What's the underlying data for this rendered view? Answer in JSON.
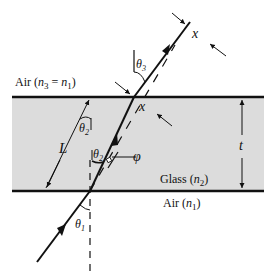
{
  "diagram": {
    "labels": {
      "air_top": "Air (",
      "air_top_n3": "n",
      "air_top_n3_sub": "3",
      "air_top_eq": " = ",
      "air_top_n1": "n",
      "air_top_n1_sub": "1",
      "air_top_close": ")",
      "glass": "Glass (",
      "glass_n": "n",
      "glass_sub": "2",
      "glass_close": ")",
      "air_bottom": "Air (",
      "air_bottom_n": "n",
      "air_bottom_sub": "1",
      "air_bottom_close": ")",
      "theta1": "θ",
      "theta1_sub": "1",
      "theta2_upper": "θ",
      "theta2_upper_sub": "2",
      "theta2_lower": "θ",
      "theta2_lower_sub": "2",
      "theta3": "θ",
      "theta3_sub": "3",
      "x_top": "x",
      "x_inner": "x",
      "L": "L",
      "phi": "φ",
      "t": "t"
    },
    "colors": {
      "glass_fill": "#dcdcdc",
      "line": "#111111",
      "background": "#ffffff"
    }
  }
}
